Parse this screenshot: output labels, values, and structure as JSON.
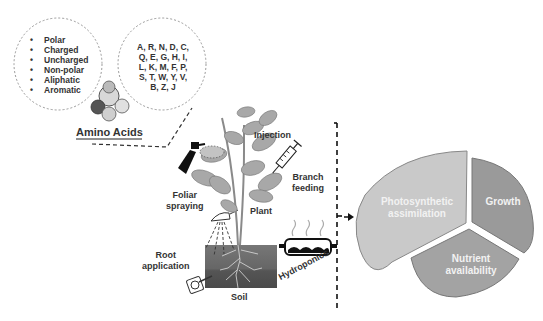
{
  "amino_acids": {
    "title": "Amino Acids",
    "properties": [
      "Polar",
      "Charged",
      "Uncharged",
      "Non-polar",
      "Aliphatic",
      "Aromatic"
    ],
    "codes": [
      "A, R, N, D, C,",
      "Q, E, G, H, I,",
      "L, K, M, F, P,",
      "S, T, W, Y, V,",
      "B, Z, J"
    ]
  },
  "application_methods": {
    "injection": "Injection",
    "branch_feeding": [
      "Branch",
      "feeding"
    ],
    "foliar_spraying": [
      "Foliar",
      "spraying"
    ],
    "plant": "Plant",
    "root_application": [
      "Root",
      "application"
    ],
    "soil": "Soil",
    "hydroponics": "Hydroponics"
  },
  "outcomes": {
    "segments": [
      {
        "label": [
          "Photosynthetic",
          "assimilation"
        ],
        "color": "#c9c9c9"
      },
      {
        "label": [
          "Growth"
        ],
        "color": "#9a9a9a"
      },
      {
        "label": [
          "Nutrient",
          "availability"
        ],
        "color": "#a3a3a3"
      }
    ]
  },
  "colors": {
    "soil_top": "#6e6e6e",
    "soil_bottom": "#4a4a4a",
    "leaf": "#a8a8a8",
    "leaf_dark": "#7d7d7d",
    "dashes": "#333333"
  }
}
